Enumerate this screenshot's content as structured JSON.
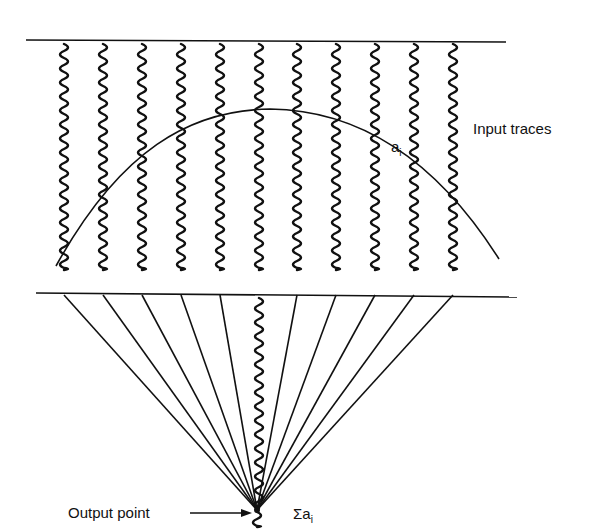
{
  "labels": {
    "input_traces": "Input traces",
    "amplitude_symbol": "a",
    "amplitude_subscript": "i",
    "output_point": "Output point",
    "sum_symbol": "Σa",
    "sum_subscript": "i"
  },
  "diagram": {
    "input_trace_count": 11,
    "center_trace_index": 5,
    "stroke_color": "#111111",
    "background": "#ffffff"
  }
}
